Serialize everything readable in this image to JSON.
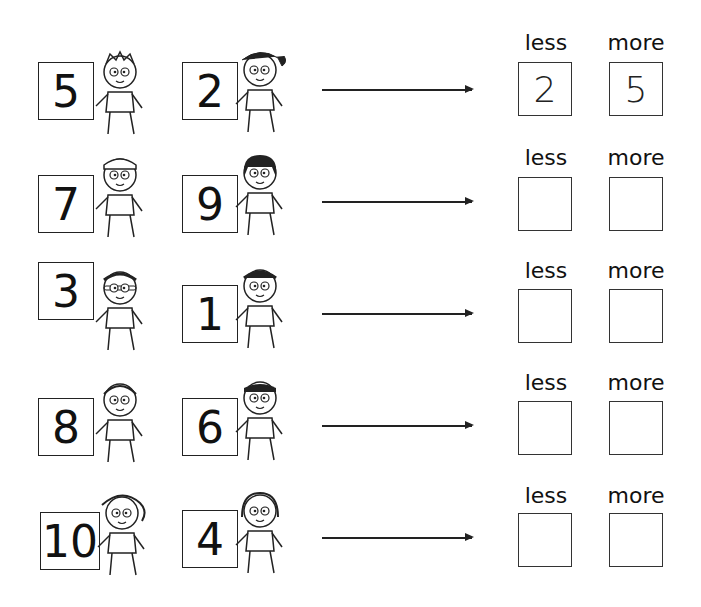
{
  "worksheet": {
    "headers": {
      "less": "less",
      "more": "more"
    },
    "rows": [
      {
        "a": "5",
        "b": "2",
        "less": "2",
        "more": "5"
      },
      {
        "a": "7",
        "b": "9",
        "less": "",
        "more": ""
      },
      {
        "a": "3",
        "b": "1",
        "less": "",
        "more": ""
      },
      {
        "a": "8",
        "b": "6",
        "less": "",
        "more": ""
      },
      {
        "a": "10",
        "b": "4",
        "less": "",
        "more": ""
      }
    ]
  }
}
